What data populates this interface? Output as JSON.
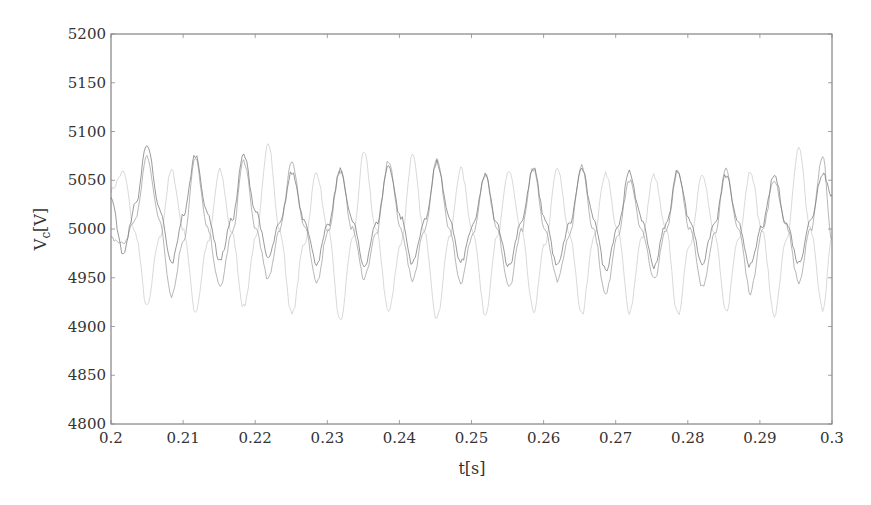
{
  "chart_data": {
    "type": "line",
    "title": "",
    "xlabel": "t[s]",
    "ylabel": "V",
    "ylabel_subscript": "c",
    "ylabel_unit": "[V]",
    "xlim": [
      0.2,
      0.3
    ],
    "ylim": [
      4800,
      5200
    ],
    "xticks": [
      0.2,
      0.21,
      0.22,
      0.23,
      0.24,
      0.25,
      0.26,
      0.27,
      0.28,
      0.29,
      0.3
    ],
    "xtick_labels": [
      "0.2",
      "0.21",
      "0.22",
      "0.23",
      "0.24",
      "0.25",
      "0.26",
      "0.27",
      "0.28",
      "0.29",
      "0.3"
    ],
    "yticks": [
      4800,
      4850,
      4900,
      4950,
      5000,
      5050,
      5100,
      5150,
      5200
    ],
    "ytick_labels": [
      "4800",
      "4850",
      "4900",
      "4950",
      "5000",
      "5050",
      "5100",
      "5150",
      "5200"
    ],
    "grid": false,
    "legend": null,
    "series": [
      {
        "name": "Vc phase a",
        "color": "#7a7a7a",
        "frequency_hz": 150,
        "x": [
          0.2,
          0.2017,
          0.2034,
          0.205,
          0.2067,
          0.2084,
          0.2101,
          0.2117,
          0.2134,
          0.2151,
          0.2168,
          0.2184,
          0.2201,
          0.2218,
          0.2234,
          0.2251,
          0.2268,
          0.2285,
          0.2301,
          0.2318,
          0.2335,
          0.2351,
          0.2368,
          0.2385,
          0.2402,
          0.2418,
          0.2435,
          0.2452,
          0.2469,
          0.2485,
          0.2502,
          0.2519,
          0.2535,
          0.2552,
          0.2569,
          0.2586,
          0.2602,
          0.2619,
          0.2636,
          0.2653,
          0.2669,
          0.2686,
          0.2703,
          0.2719,
          0.2736,
          0.2753,
          0.277,
          0.2786,
          0.2803,
          0.282,
          0.2837,
          0.2853,
          0.287,
          0.2887,
          0.2903,
          0.292,
          0.2937,
          0.2954,
          0.297,
          0.2987,
          0.3
        ],
        "y": [
          5030,
          4975,
          5025,
          5088,
          5020,
          4965,
          5015,
          5076,
          5015,
          4968,
          5010,
          5076,
          5018,
          4970,
          5005,
          5058,
          5010,
          4965,
          5003,
          5060,
          5008,
          4962,
          5005,
          5065,
          5012,
          4965,
          5008,
          5068,
          5012,
          4965,
          5003,
          5055,
          5005,
          4962,
          5008,
          5062,
          5010,
          4962,
          5005,
          5062,
          5012,
          4958,
          5003,
          5058,
          5010,
          4962,
          5005,
          5060,
          5008,
          4965,
          5005,
          5055,
          5005,
          4962,
          5003,
          5055,
          5005,
          4965,
          5008,
          5058,
          5035
        ]
      },
      {
        "name": "Vc phase b",
        "color": "#a0a0a0",
        "frequency_hz": 150,
        "x": [
          0.2,
          0.2017,
          0.2034,
          0.205,
          0.2067,
          0.2084,
          0.2101,
          0.2117,
          0.2134,
          0.2151,
          0.2168,
          0.2184,
          0.2201,
          0.2218,
          0.2234,
          0.2251,
          0.2268,
          0.2285,
          0.2301,
          0.2318,
          0.2335,
          0.2351,
          0.2368,
          0.2385,
          0.2402,
          0.2418,
          0.2435,
          0.2452,
          0.2469,
          0.2485,
          0.2502,
          0.2519,
          0.2535,
          0.2552,
          0.2569,
          0.2586,
          0.2602,
          0.2619,
          0.2636,
          0.2653,
          0.2669,
          0.2686,
          0.2703,
          0.2719,
          0.2736,
          0.2753,
          0.277,
          0.2786,
          0.2803,
          0.282,
          0.2837,
          0.2853,
          0.287,
          0.2887,
          0.2903,
          0.292,
          0.2937,
          0.2954,
          0.297,
          0.2987,
          0.3
        ],
        "y": [
          4990,
          4985,
          5010,
          5075,
          5010,
          4932,
          4990,
          5072,
          5000,
          4940,
          4995,
          5070,
          5000,
          4948,
          5000,
          5070,
          5003,
          4945,
          4998,
          5060,
          5000,
          4950,
          4995,
          5070,
          5000,
          4948,
          5000,
          5070,
          5003,
          4945,
          4995,
          5055,
          5000,
          4940,
          4998,
          5062,
          5000,
          4948,
          4995,
          5065,
          5000,
          4932,
          4995,
          5050,
          5000,
          4948,
          4998,
          5060,
          5000,
          4940,
          4995,
          5060,
          5000,
          4935,
          4998,
          5050,
          5003,
          4945,
          4998,
          5075,
          4990
        ]
      },
      {
        "name": "Vc phase c",
        "color": "#cdcdcd",
        "frequency_hz": 150,
        "x": [
          0.2,
          0.2017,
          0.2034,
          0.205,
          0.2067,
          0.2084,
          0.2101,
          0.2117,
          0.2134,
          0.2151,
          0.2168,
          0.2184,
          0.2201,
          0.2218,
          0.2234,
          0.2251,
          0.2268,
          0.2285,
          0.2301,
          0.2318,
          0.2335,
          0.2351,
          0.2368,
          0.2385,
          0.2402,
          0.2418,
          0.2435,
          0.2452,
          0.2469,
          0.2485,
          0.2502,
          0.2519,
          0.2535,
          0.2552,
          0.2569,
          0.2586,
          0.2602,
          0.2619,
          0.2636,
          0.2653,
          0.2669,
          0.2686,
          0.2703,
          0.2719,
          0.2736,
          0.2753,
          0.277,
          0.2786,
          0.2803,
          0.282,
          0.2837,
          0.2853,
          0.287,
          0.2887,
          0.2903,
          0.292,
          0.2937,
          0.2954,
          0.297,
          0.2987,
          0.3
        ],
        "y": [
          5040,
          5058,
          4995,
          4920,
          4990,
          5060,
          4998,
          4915,
          4985,
          5060,
          4995,
          4920,
          4990,
          5090,
          4998,
          4912,
          4985,
          5058,
          4998,
          4905,
          4990,
          5078,
          4998,
          4915,
          4985,
          5075,
          4995,
          4908,
          4990,
          5062,
          4998,
          4912,
          4990,
          5060,
          4998,
          4915,
          4985,
          5062,
          4995,
          4912,
          4990,
          5058,
          4998,
          4915,
          4990,
          5055,
          4998,
          4912,
          4985,
          5058,
          4995,
          4915,
          4990,
          5060,
          4998,
          4912,
          4990,
          5082,
          5000,
          4918,
          4990
        ]
      }
    ]
  }
}
